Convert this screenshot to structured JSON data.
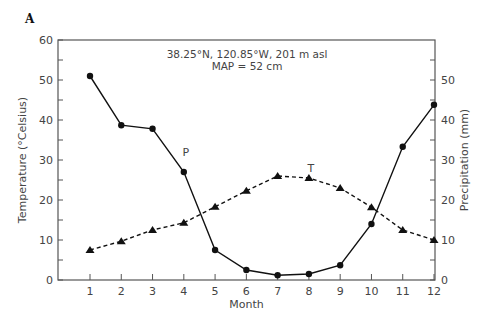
{
  "panel_label": "A",
  "chart_data": {
    "type": "line",
    "title": "",
    "annotation_lines": [
      "38.25°N, 120.85°W, 201 m asl",
      "MAP = 52 cm"
    ],
    "xlabel": "Month",
    "ylabel": "Temperature (°Celsius)",
    "y2label": "Precipitation (mm)",
    "categories": [
      1,
      2,
      3,
      4,
      5,
      6,
      7,
      8,
      9,
      10,
      11,
      12
    ],
    "x_ticks": [
      "1",
      "2",
      "3",
      "4",
      "5",
      "6",
      "7",
      "8",
      "9",
      "10",
      "11",
      "12"
    ],
    "ylim": [
      0,
      60
    ],
    "y_ticks": [
      "0",
      "10",
      "20",
      "30",
      "40",
      "50",
      "60"
    ],
    "y2lim": [
      0,
      60
    ],
    "y2_ticks": [
      "0",
      "10",
      "20",
      "30",
      "40",
      "50"
    ],
    "grid": false,
    "legend": "inline labels",
    "series": [
      {
        "name": "P",
        "axis": "right",
        "label": "Precipitation",
        "marker": "circle",
        "line_style": "solid",
        "values": [
          51,
          38.7,
          37.8,
          27,
          7.5,
          2.5,
          1.2,
          1.5,
          3.7,
          14,
          33.3,
          43.8
        ]
      },
      {
        "name": "T",
        "axis": "left",
        "label": "Temperature",
        "marker": "triangle",
        "line_style": "dashed",
        "values": [
          7.5,
          9.7,
          12.5,
          14.3,
          18.3,
          22.3,
          26,
          25.5,
          23,
          18.2,
          12.5,
          10
        ]
      }
    ],
    "series_label_positions": {
      "P": [
        4,
        32
      ],
      "T": [
        8,
        28
      ]
    }
  }
}
